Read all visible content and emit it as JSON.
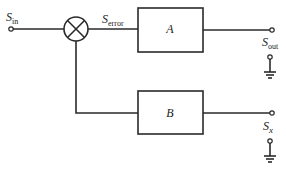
{
  "diagram": {
    "type": "block-diagram",
    "nodes": {
      "input": {
        "label": "S",
        "subscript": "in"
      },
      "error": {
        "label": "S",
        "subscript": "error"
      },
      "summing_junction": {
        "symbol": "circle-x"
      },
      "block_a": {
        "label": "A"
      },
      "block_b": {
        "label": "B"
      },
      "output": {
        "label": "S",
        "subscript": "out"
      },
      "secondary_output": {
        "label": "S",
        "subscript": "x"
      }
    },
    "edges": [
      {
        "from": "input",
        "to": "summing_junction"
      },
      {
        "from": "summing_junction",
        "to": "block_a",
        "label": "S_error"
      },
      {
        "from": "block_a",
        "to": "output"
      },
      {
        "from": "summing_junction",
        "to": "block_b"
      },
      {
        "from": "block_b",
        "to": "secondary_output"
      }
    ],
    "grounds": [
      "output",
      "secondary_output"
    ],
    "colors": {
      "line": "#2a2a2a",
      "background": "#ffffff"
    }
  }
}
